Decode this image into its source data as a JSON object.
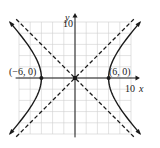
{
  "chart_data": {
    "type": "line",
    "title": "",
    "xlabel": "x",
    "ylabel": "y",
    "xlim": [
      -10.5,
      10.5
    ],
    "ylim": [
      -10.5,
      10.5
    ],
    "grid": true,
    "grid_step": 2,
    "x_tick_labels": [
      "10"
    ],
    "y_tick_labels": [
      "10"
    ],
    "equation_description": "hyperbola x^2/36 - y^2/36 = 1",
    "series": [
      {
        "name": "hyperbola-right-branch",
        "style": "solid",
        "a": 6,
        "b": 6,
        "branch": "right"
      },
      {
        "name": "hyperbola-left-branch",
        "style": "solid",
        "a": 6,
        "b": 6,
        "branch": "left"
      },
      {
        "name": "asymptote-positive",
        "style": "dashed",
        "slope": 1,
        "intercept": 0
      },
      {
        "name": "asymptote-negative",
        "style": "dashed",
        "slope": -1,
        "intercept": 0
      }
    ],
    "points": [
      {
        "label": "(−6, 0)",
        "x": -6,
        "y": 0
      },
      {
        "label": "(6, 0)",
        "x": 6,
        "y": 0
      },
      {
        "label": "",
        "x": 0,
        "y": 0,
        "marker": "square"
      }
    ],
    "colors": {
      "curve": "#1a1a1a",
      "grid": "#cfcfcf",
      "axis": "#1a1a1a"
    }
  }
}
